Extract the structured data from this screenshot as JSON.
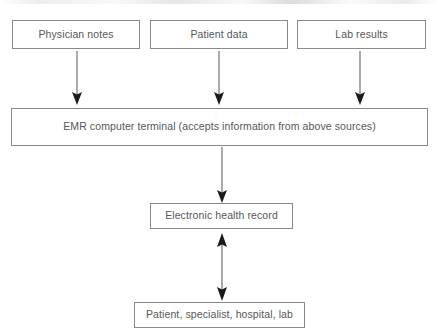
{
  "diagram": {
    "type": "flowchart",
    "orientation": "top-to-bottom",
    "background_color": "#ffffff",
    "border_color": "#8a8a8a",
    "text_color": "#55585a",
    "arrow_line_color": "#6f7274",
    "arrowhead_color": "#1b1b1b",
    "nodes": [
      {
        "id": "physician-notes",
        "label": "Physician notes",
        "row": 1
      },
      {
        "id": "patient-data",
        "label": "Patient data",
        "row": 1
      },
      {
        "id": "lab-results",
        "label": "Lab results",
        "row": 1
      },
      {
        "id": "emr-terminal",
        "label": "EMR computer terminal (accepts information from above sources)",
        "row": 2
      },
      {
        "id": "ehr",
        "label": "Electronic health record",
        "row": 3
      },
      {
        "id": "recipients",
        "label": "Patient, specialist, hospital, lab",
        "row": 4
      }
    ],
    "edges": [
      {
        "id": "notes-to-emr",
        "from": "physician-notes",
        "to": "emr-terminal",
        "direction": "down",
        "arrowheads": 1
      },
      {
        "id": "data-to-emr",
        "from": "patient-data",
        "to": "emr-terminal",
        "direction": "down",
        "arrowheads": 1
      },
      {
        "id": "lab-to-emr",
        "from": "lab-results",
        "to": "emr-terminal",
        "direction": "down",
        "arrowheads": 1
      },
      {
        "id": "emr-to-ehr",
        "from": "emr-terminal",
        "to": "ehr",
        "direction": "down",
        "arrowheads": 1
      },
      {
        "id": "ehr-recipients",
        "from": "ehr",
        "to": "recipients",
        "direction": "both",
        "arrowheads": 2
      }
    ]
  }
}
